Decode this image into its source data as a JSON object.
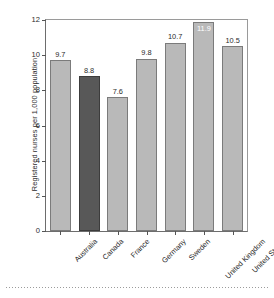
{
  "chart_data": {
    "type": "bar",
    "title": "",
    "xlabel": "",
    "ylabel": "Registered nurses per 1,000 population",
    "ylim": [
      0,
      12
    ],
    "yticks": [
      0,
      2,
      4,
      6,
      8,
      10,
      12
    ],
    "ytick_labels": [
      "0",
      "2",
      "4",
      "6",
      "8",
      "10",
      "12"
    ],
    "grid": false,
    "legend": null,
    "categories": [
      "Australia",
      "Canada",
      "France",
      "Germany",
      "Sweden",
      "United Kingdom",
      "United States"
    ],
    "values": [
      9.7,
      8.8,
      7.6,
      9.8,
      10.7,
      11.9,
      10.5
    ],
    "value_labels": [
      "9.7",
      "8.8",
      "7.6",
      "9.8",
      "10.7",
      "11.9",
      "10.5"
    ],
    "highlight_index": 5,
    "highlight_category": "Canada",
    "bar_colors": [
      "#b9b9b9",
      "#585858",
      "#b9b9b9",
      "#b9b9b9",
      "#b9b9b9",
      "#b9b9b9",
      "#b9b9b9"
    ],
    "label_placement": [
      "above",
      "above",
      "above",
      "above",
      "above",
      "inside",
      "above"
    ],
    "colors": {
      "bar_light": "#b9b9b9",
      "bar_dark": "#585858",
      "bar_edge": "#7b7b7b",
      "axis": "#6d6d6d",
      "text": "#2b2b2b",
      "inside_label_text": "#ffffff"
    }
  }
}
